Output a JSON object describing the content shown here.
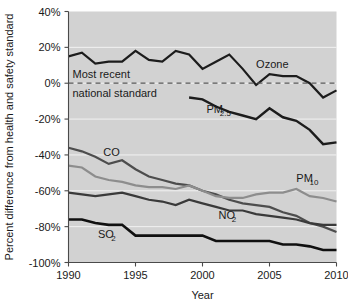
{
  "chart_data": {
    "type": "line",
    "title": "",
    "xlabel": "Year",
    "ylabel": "Percent difference from health and safety standard",
    "xlim": [
      1990,
      2010
    ],
    "ylim": [
      -100,
      40
    ],
    "grid": true,
    "legend_position": "inline-labels",
    "x_ticks": [
      "1990",
      "1995",
      "2000",
      "2005",
      "2010"
    ],
    "x_tick_values": [
      1990,
      1995,
      2000,
      2005,
      2010
    ],
    "y_ticks": [
      "40%",
      "20%",
      "0%",
      "-20%",
      "-40%",
      "-60%",
      "-80%",
      "-100%"
    ],
    "y_tick_values": [
      40,
      20,
      0,
      -20,
      -40,
      -60,
      -80,
      -100
    ],
    "annotations": [
      {
        "name": "standard-reference-line",
        "line1": "Most recent",
        "line2": "national standard",
        "value": 0
      }
    ],
    "series": [
      {
        "name": "Ozone",
        "color": "#1c1c1c",
        "width": 2.2,
        "label": "Ozone",
        "label_sub": "",
        "x": [
          1990,
          1991,
          1992,
          1993,
          1994,
          1995,
          1996,
          1997,
          1998,
          1999,
          2000,
          2001,
          2002,
          2003,
          2004,
          2005,
          2006,
          2007,
          2008,
          2009,
          2010
        ],
        "values": [
          15,
          17,
          11,
          12,
          12,
          18,
          13,
          12,
          18,
          16,
          8,
          12,
          16,
          8,
          -1,
          5,
          4,
          4,
          0,
          -8,
          -4
        ]
      },
      {
        "name": "PM2.5",
        "color": "#1c1c1c",
        "width": 2.4,
        "label": "PM",
        "label_sub": "2.5",
        "x": [
          1999,
          2000,
          2001,
          2002,
          2003,
          2004,
          2005,
          2006,
          2007,
          2008,
          2009,
          2010
        ],
        "values": [
          -8,
          -9,
          -13,
          -16,
          -18,
          -20,
          -14,
          -19,
          -21,
          -26,
          -34,
          -33
        ]
      },
      {
        "name": "CO",
        "color": "#4d4d4d",
        "width": 2.2,
        "label": "CO",
        "label_sub": "",
        "x": [
          1990,
          1991,
          1992,
          1993,
          1994,
          1995,
          1996,
          1997,
          1998,
          1999,
          2000,
          2001,
          2002,
          2003,
          2004,
          2005,
          2006,
          2007,
          2008,
          2009,
          2010
        ],
        "values": [
          -36,
          -38,
          -41,
          -45,
          -43,
          -48,
          -52,
          -54,
          -56,
          -57,
          -60,
          -62,
          -65,
          -67,
          -68,
          -69,
          -72,
          -74,
          -78,
          -80,
          -83
        ]
      },
      {
        "name": "PM10",
        "color": "#8d8d8d",
        "width": 2.2,
        "label": "PM",
        "label_sub": "10",
        "x": [
          1990,
          1991,
          1992,
          1993,
          1994,
          1995,
          1996,
          1997,
          1998,
          1999,
          2000,
          2001,
          2002,
          2003,
          2004,
          2005,
          2006,
          2007,
          2008,
          2009,
          2010
        ],
        "values": [
          -46,
          -47,
          -52,
          -54,
          -55,
          -57,
          -58,
          -58,
          -59,
          -57,
          -60,
          -63,
          -64,
          -64,
          -62,
          -61,
          -61,
          -59,
          -63,
          -64,
          -66
        ]
      },
      {
        "name": "NO2",
        "color": "#3a3a3a",
        "width": 2.2,
        "label": "NO",
        "label_sub": "2",
        "x": [
          1990,
          1991,
          1992,
          1993,
          1994,
          1995,
          1996,
          1997,
          1998,
          1999,
          2000,
          2001,
          2002,
          2003,
          2004,
          2005,
          2006,
          2007,
          2008,
          2009,
          2010
        ],
        "values": [
          -61,
          -62,
          -63,
          -62,
          -61,
          -63,
          -65,
          -66,
          -68,
          -65,
          -67,
          -69,
          -71,
          -71,
          -73,
          -74,
          -75,
          -76,
          -78,
          -79,
          -79
        ]
      },
      {
        "name": "SO2",
        "color": "#101010",
        "width": 2.6,
        "label": "SO",
        "label_sub": "2",
        "x": [
          1990,
          1991,
          1992,
          1993,
          1994,
          1995,
          1996,
          1997,
          1998,
          1999,
          2000,
          2001,
          2002,
          2003,
          2004,
          2005,
          2006,
          2007,
          2008,
          2009,
          2010
        ],
        "values": [
          -76,
          -76,
          -78,
          -79,
          -79,
          -85,
          -85,
          -85,
          -85,
          -85,
          -85,
          -88,
          -88,
          -88,
          -88,
          -88,
          -90,
          -90,
          -91,
          -93,
          -93
        ]
      }
    ],
    "series_label_positions": [
      {
        "series": "Ozone",
        "x": 2004.0,
        "y": 8.5
      },
      {
        "series": "PM2.5",
        "x": 2000.3,
        "y": -16.5
      },
      {
        "series": "CO",
        "x": 1992.6,
        "y": -40.5
      },
      {
        "series": "PM10",
        "x": 2007.0,
        "y": -55.0
      },
      {
        "series": "NO2",
        "x": 2001.2,
        "y": -76.0
      },
      {
        "series": "SO2",
        "x": 1992.2,
        "y": -86.5
      }
    ]
  }
}
